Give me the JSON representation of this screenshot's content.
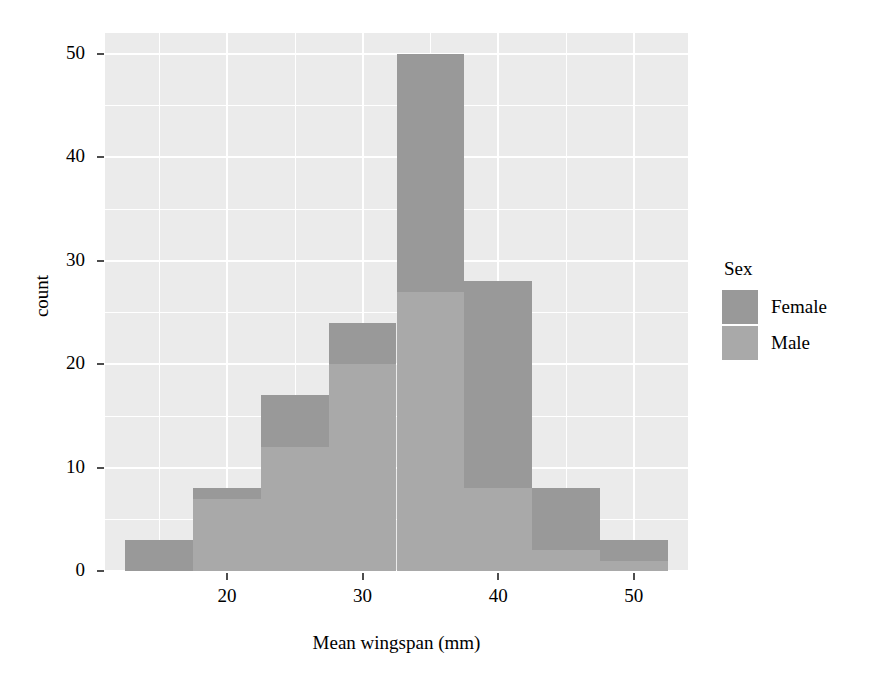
{
  "chart_data": {
    "type": "bar",
    "title": "",
    "subtitle": "",
    "xlabel": "Mean wingspan (mm)",
    "ylabel": "count",
    "xlim": [
      11.0,
      54.0
    ],
    "ylim": [
      0,
      52
    ],
    "xticks": [
      20,
      30,
      40,
      50
    ],
    "xtick_labels": [
      "20",
      "30",
      "40",
      "50"
    ],
    "yticks": [
      0,
      10,
      20,
      30,
      40,
      50
    ],
    "ytick_labels": [
      "0",
      "10",
      "20",
      "30",
      "40",
      "50"
    ],
    "grid": true,
    "stacked": true,
    "bin_width": 5,
    "bin_edges": [
      12.5,
      17.5,
      22.5,
      27.5,
      32.5,
      37.5,
      42.5,
      47.5,
      52.5
    ],
    "bin_centers": [
      15,
      20,
      25,
      30,
      35,
      40,
      45,
      50
    ],
    "categories": [
      "15",
      "20",
      "25",
      "30",
      "35",
      "40",
      "45",
      "50"
    ],
    "series": [
      {
        "name": "Male",
        "color": "#a9a9a9",
        "values": [
          0,
          7,
          12,
          20,
          27,
          8,
          2,
          1
        ]
      },
      {
        "name": "Female",
        "color": "#999999",
        "values": [
          3,
          1,
          5,
          4,
          23,
          20,
          6,
          2
        ]
      }
    ],
    "totals": [
      3,
      8,
      17,
      24,
      50,
      28,
      8,
      3
    ],
    "legend": {
      "title": "Sex",
      "position": "right",
      "entries": [
        {
          "label": "Female",
          "color": "#999999"
        },
        {
          "label": "Male",
          "color": "#a9a9a9"
        }
      ]
    },
    "panel_background": "#ebebeb",
    "grid_color": "#ffffff",
    "axis_text_color": "#000000"
  }
}
